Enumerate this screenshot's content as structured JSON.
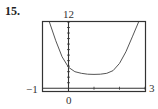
{
  "problem": {
    "number": "15."
  },
  "chart_data": {
    "type": "line",
    "title": "",
    "xlabel": "",
    "ylabel": "",
    "xlim": [
      -1,
      3
    ],
    "ylim": [
      -0.5,
      12
    ],
    "tick_labels": {
      "ymax": "12",
      "xorigin": "0",
      "xmin": "-1",
      "xmax": "3"
    },
    "x_ticks": [
      0,
      1,
      2,
      3
    ],
    "y_ticks": [
      1,
      2,
      3,
      4,
      5,
      6,
      7,
      8,
      9,
      10,
      11,
      12
    ],
    "grid": false,
    "legend": null,
    "series": [
      {
        "name": "f(x)",
        "x": [
          -0.75,
          -0.5,
          -0.25,
          0,
          0.25,
          0.5,
          0.75,
          1.0,
          1.25,
          1.5,
          1.75,
          2.0,
          2.25,
          2.5,
          2.75
        ],
        "values": [
          12,
          8.6,
          5.7,
          3.8,
          3.0,
          2.7,
          2.55,
          2.5,
          2.55,
          2.7,
          3.2,
          4.5,
          6.6,
          9.3,
          12
        ]
      }
    ],
    "colors": {
      "curve": "#555555",
      "frame": "#333333",
      "axes": "#333333"
    }
  }
}
